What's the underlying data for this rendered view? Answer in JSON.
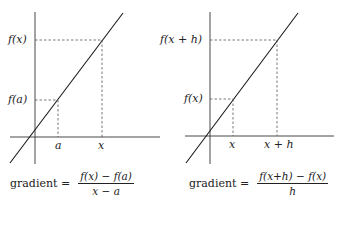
{
  "left_panel": {
    "y_labels": {
      "upper": "f(x)",
      "lower": "f(a)"
    },
    "x_labels": {
      "left": "a",
      "right": "x"
    },
    "formula": {
      "word": "gradient =",
      "numerator": "f(x) − f(a)",
      "denominator": "x − a"
    }
  },
  "right_panel": {
    "y_labels": {
      "upper": "f(x + h)",
      "lower": "f(x)"
    },
    "x_labels": {
      "left": "x",
      "right": "x + h"
    },
    "formula": {
      "word": "gradient =",
      "numerator": "f(x+h) − f(x)",
      "denominator": "h"
    }
  },
  "colors": {
    "line": "#1a1a1a",
    "axes": "#333333",
    "dashed": "#555555"
  }
}
